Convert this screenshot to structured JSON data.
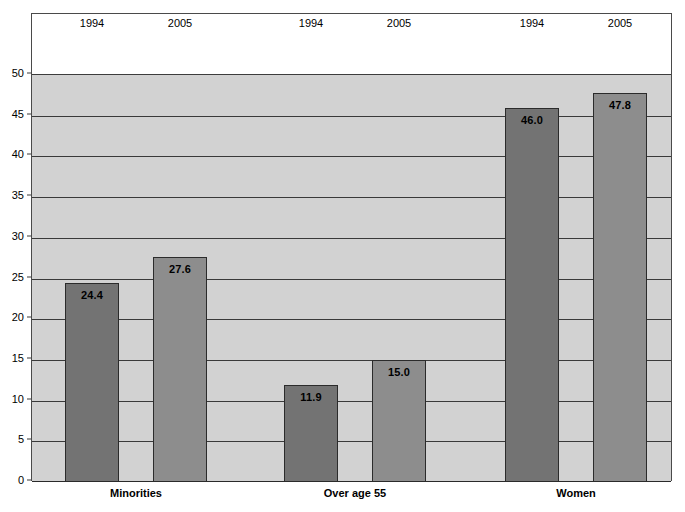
{
  "chart_data": {
    "type": "bar",
    "title": "",
    "xlabel": "",
    "ylabel": "",
    "ylim": [
      0,
      50
    ],
    "ytick_step": 5,
    "yticks": [
      "50",
      "45",
      "40",
      "35",
      "30",
      "25",
      "20",
      "15",
      "10",
      "5",
      "0"
    ],
    "grid": true,
    "legend_position": "top-inline-year-labels",
    "categories": [
      "Minorities",
      "Over age 55",
      "Women"
    ],
    "series": [
      {
        "name": "1994",
        "values": [
          24.4,
          11.9,
          46.0
        ],
        "color": "#737373"
      },
      {
        "name": "2005",
        "values": [
          27.6,
          15.0,
          47.8
        ],
        "color": "#8d8d8d"
      }
    ],
    "bar_labels": [
      {
        "text": "24.4",
        "series": "1994",
        "category": "Minorities"
      },
      {
        "text": "27.6",
        "series": "2005",
        "category": "Minorities"
      },
      {
        "text": "11.9",
        "series": "1994",
        "category": "Over age 55"
      },
      {
        "text": "15.0",
        "series": "2005",
        "category": "Over age 55"
      },
      {
        "text": "46.0",
        "series": "1994",
        "category": "Women"
      },
      {
        "text": "47.8",
        "series": "2005",
        "category": "Women"
      }
    ],
    "column_headers": [
      "1994",
      "2005",
      "1994",
      "2005",
      "1994",
      "2005"
    ],
    "plot_background": "#d2d2d2",
    "header_background": "#ffffff",
    "gridline_color": "#3a3a3a",
    "frame_color": "#4a4a4a"
  }
}
